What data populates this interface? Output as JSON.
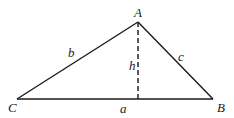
{
  "diagram": {
    "type": "triangle-with-altitude",
    "stroke_color": "#1a1a1a",
    "background": "#ffffff",
    "vertices": {
      "A": {
        "label": "A",
        "x": 138,
        "y": 22
      },
      "B": {
        "label": "B",
        "x": 213,
        "y": 99
      },
      "C": {
        "label": "C",
        "x": 17,
        "y": 99
      }
    },
    "sides": {
      "a": {
        "label": "a",
        "from": "C",
        "to": "B"
      },
      "b": {
        "label": "b",
        "from": "C",
        "to": "A"
      },
      "c": {
        "label": "c",
        "from": "A",
        "to": "B"
      }
    },
    "altitude": {
      "label": "h",
      "from": "A",
      "foot": {
        "x": 138,
        "y": 99
      },
      "style": "dashed"
    }
  }
}
